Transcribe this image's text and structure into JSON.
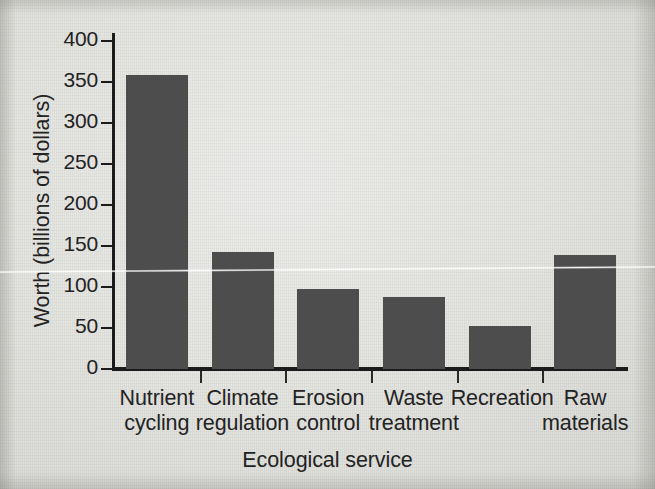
{
  "chart_data": {
    "type": "bar",
    "title": "",
    "subtitle": "",
    "xlabel": "Ecological service",
    "ylabel": "Worth (billions of dollars)",
    "categories": [
      "Nutrient cycling",
      "Climate regulation",
      "Erosion control",
      "Waste treatment",
      "Recreation",
      "Raw materials"
    ],
    "category_lines": [
      [
        "Nutrient",
        "cycling"
      ],
      [
        "Climate",
        "regulation"
      ],
      [
        "Erosion",
        "control"
      ],
      [
        "Waste",
        "treatment"
      ],
      [
        "Recreation",
        ""
      ],
      [
        "Raw",
        "materials"
      ]
    ],
    "values": [
      358,
      143,
      98,
      88,
      52,
      139
    ],
    "ylim": [
      0,
      400
    ],
    "ytick_values": [
      0,
      50,
      100,
      150,
      200,
      250,
      300,
      350,
      400
    ],
    "ytick_labels": [
      "0",
      "50",
      "100",
      "150",
      "200",
      "250",
      "300",
      "350",
      "400"
    ],
    "grid": false,
    "legend": null,
    "legend_position": "none",
    "bar_color": "#4d4d4d",
    "axis_color": "#1b1b1b",
    "background_color": "#e2e2de",
    "annotations": []
  }
}
